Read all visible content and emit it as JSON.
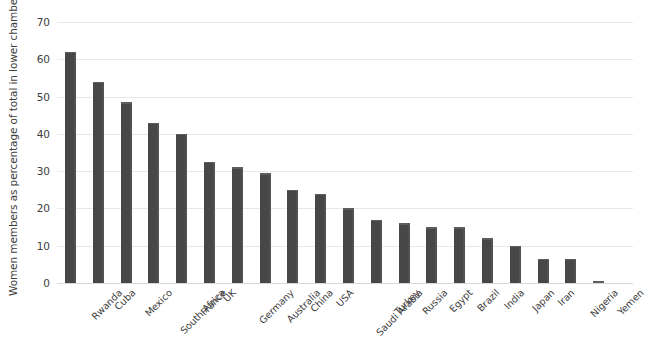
{
  "chart_data": {
    "type": "bar",
    "title": "",
    "xlabel": "",
    "ylabel": "Women members as percentage of total in lower chamber",
    "ylim": [
      0,
      70
    ],
    "yticks": [
      0,
      10,
      20,
      30,
      40,
      50,
      60,
      70
    ],
    "grid": true,
    "legend": "none",
    "orientation": "vertical",
    "bar_color": "#474747",
    "categories": [
      "Rwanda",
      "Cuba",
      "Mexico",
      "South Africa",
      "France",
      "UK",
      "Germany",
      "Australia",
      "China",
      "USA",
      "Saudi Arabia",
      "Turkey",
      "Russia",
      "Egypt",
      "Brazil",
      "India",
      "Japan",
      "Iran",
      "Nigeria",
      "Yemen"
    ],
    "values": [
      62,
      54,
      48.5,
      43,
      40,
      32.5,
      31,
      29.5,
      25,
      24,
      20,
      17,
      16,
      15,
      15,
      12,
      10,
      6.5,
      6.5,
      0.5
    ]
  }
}
